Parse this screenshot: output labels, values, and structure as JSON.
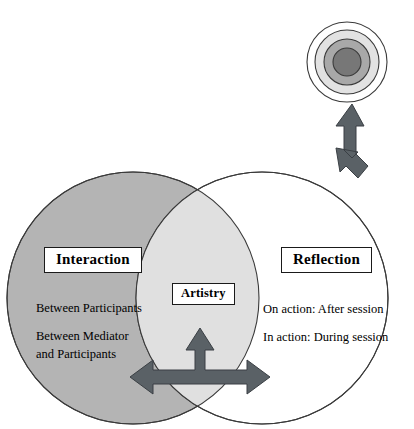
{
  "diagram": {
    "type": "venn-diagram-with-arrows",
    "title_text": "",
    "background_color": "#ffffff",
    "circles": {
      "interaction": {
        "label": "Interaction",
        "fill_color": "#b4b4b4",
        "stroke_color": "#3a3a3a",
        "center_x": 133,
        "center_y": 298,
        "radius": 126,
        "details": [
          "Between Participants",
          "Between Mediator and Participants"
        ],
        "detail_lines": [
          "Between Participants",
          "Between Mediator",
          "and Participants"
        ]
      },
      "reflection": {
        "label": "Reflection",
        "fill_color": "#ffffff",
        "stroke_color": "#3a3a3a",
        "center_x": 262,
        "center_y": 298,
        "radius": 126,
        "details": [
          "On action: After session",
          "In action: During session"
        ]
      },
      "overlap": {
        "label": "Artistry",
        "fill_color": "#e0e0e0",
        "stroke_color": "#3a3a3a"
      }
    },
    "target": {
      "name": "concentric-target",
      "center_x": 347,
      "center_y": 62,
      "rings": [
        {
          "radius": 40,
          "fill": "#ffffff",
          "stroke": "#3a3a3a"
        },
        {
          "radius": 32,
          "fill": "#e2e2e2",
          "stroke": "#3a3a3a"
        },
        {
          "radius": 23,
          "fill": "#a8a8a8",
          "stroke": "#3a3a3a"
        },
        {
          "radius": 14,
          "fill": "#777777",
          "stroke": "#3a3a3a"
        }
      ]
    },
    "arrows": {
      "fill_color": "#5a6166",
      "stroke_color": "#3a3f44",
      "upper": {
        "name": "bent-double-arrow-reflection-to-target",
        "directions": [
          "up",
          "down-left"
        ]
      },
      "lower": {
        "name": "tri-directional-arrow",
        "directions": [
          "up",
          "left",
          "right"
        ]
      }
    },
    "colors": {
      "interaction_gray": "#b4b4b4",
      "overlap_gray": "#e0e0e0",
      "arrow_slate": "#5a6166",
      "outline_black": "#3a3a3a",
      "text_black": "#000000"
    }
  }
}
